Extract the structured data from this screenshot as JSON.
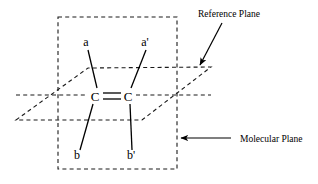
{
  "figure": {
    "type": "chemical-structure-diagram",
    "title_text": "",
    "background_color": "#ffffff",
    "stroke_color": "#000000",
    "width": 318,
    "height": 184
  },
  "molecule": {
    "atoms": [
      {
        "id": "c-left",
        "label": "C",
        "x": 95,
        "y": 96
      },
      {
        "id": "c-right",
        "label": "C",
        "x": 128,
        "y": 96
      }
    ],
    "double_bond": {
      "label": "C=C double bond",
      "x1": 102,
      "y1": 93,
      "x2": 121,
      "y2": 93,
      "x3": 102,
      "y3": 99,
      "x4": 121,
      "y4": 99
    },
    "substituents": [
      {
        "id": "a",
        "label": "a",
        "label_x": 86,
        "label_y": 46,
        "bond": {
          "x1": 88,
          "y1": 50,
          "x2": 97,
          "y2": 88
        }
      },
      {
        "id": "a-prime",
        "label": "a'",
        "label_x": 143,
        "label_y": 46,
        "bond": {
          "x1": 146,
          "y1": 50,
          "x2": 131,
          "y2": 88
        }
      },
      {
        "id": "b",
        "label": "b",
        "label_x": 74,
        "label_y": 158,
        "bond": {
          "x1": 80,
          "y1": 150,
          "x2": 93,
          "y2": 104
        }
      },
      {
        "id": "b-prime",
        "label": "b'",
        "label_x": 128,
        "label_y": 158,
        "bond": {
          "x1": 131,
          "y1": 150,
          "x2": 130,
          "y2": 104
        }
      }
    ]
  },
  "planes": {
    "molecular_plane": {
      "name": "Molecular Plane",
      "shape": "dashed-rectangle",
      "x": 58,
      "y": 17,
      "width": 119,
      "height": 152
    },
    "reference_plane": {
      "name": "Reference Plane",
      "shape": "dashed-parallelogram",
      "points": "16,120 88,68 211,67 142,120"
    },
    "reference_plane_midline": {
      "name": "reference-plane-midline",
      "x1": 16,
      "y1": 95,
      "x2": 211,
      "y2": 95
    }
  },
  "annotations": [
    {
      "id": "reference-plane",
      "text": "Reference Plane",
      "text_x": 198,
      "text_y": 17,
      "arrow": {
        "x1": 222,
        "y1": 23,
        "x2": 199,
        "y2": 66
      }
    },
    {
      "id": "molecular-plane",
      "text": "Molecular Plane",
      "text_x": 240,
      "text_y": 142,
      "arrow": {
        "x1": 231,
        "y1": 138,
        "x2": 180,
        "y2": 138
      }
    }
  ]
}
